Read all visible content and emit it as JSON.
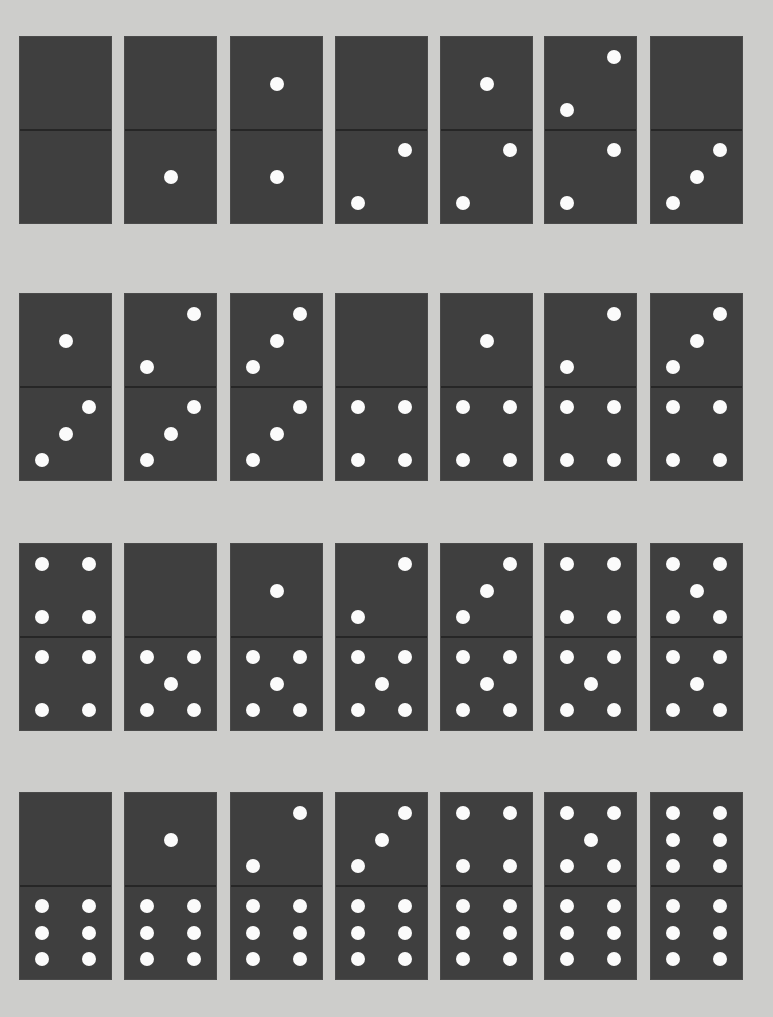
{
  "colors": {
    "background": "#cdcdcb",
    "tile": "#3f3f3f",
    "divider": "#262626",
    "pip": "#fbfbfb"
  },
  "layout": {
    "rows": 4,
    "columns": 7,
    "row_tops": [
      37,
      294,
      544,
      793
    ],
    "column_lefts": [
      20,
      125,
      231,
      336,
      441,
      545,
      651
    ]
  },
  "dominoes": [
    {
      "top": 0,
      "bottom": 0
    },
    {
      "top": 0,
      "bottom": 1
    },
    {
      "top": 1,
      "bottom": 1
    },
    {
      "top": 0,
      "bottom": 2
    },
    {
      "top": 1,
      "bottom": 2
    },
    {
      "top": 2,
      "bottom": 2
    },
    {
      "top": 0,
      "bottom": 3
    },
    {
      "top": 1,
      "bottom": 3
    },
    {
      "top": 2,
      "bottom": 3
    },
    {
      "top": 3,
      "bottom": 3
    },
    {
      "top": 0,
      "bottom": 4
    },
    {
      "top": 1,
      "bottom": 4
    },
    {
      "top": 2,
      "bottom": 4
    },
    {
      "top": 3,
      "bottom": 4
    },
    {
      "top": 4,
      "bottom": 4
    },
    {
      "top": 0,
      "bottom": 5
    },
    {
      "top": 1,
      "bottom": 5
    },
    {
      "top": 2,
      "bottom": 5
    },
    {
      "top": 3,
      "bottom": 5
    },
    {
      "top": 4,
      "bottom": 5
    },
    {
      "top": 5,
      "bottom": 5
    },
    {
      "top": 0,
      "bottom": 6
    },
    {
      "top": 1,
      "bottom": 6
    },
    {
      "top": 2,
      "bottom": 6
    },
    {
      "top": 3,
      "bottom": 6
    },
    {
      "top": 4,
      "bottom": 6
    },
    {
      "top": 5,
      "bottom": 6
    },
    {
      "top": 6,
      "bottom": 6
    }
  ]
}
